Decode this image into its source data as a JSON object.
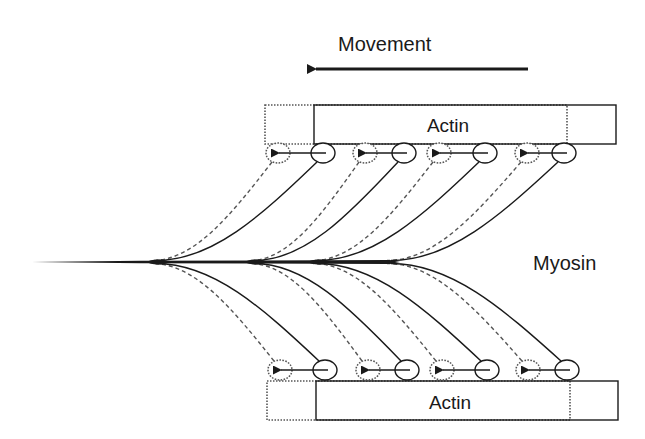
{
  "diagram": {
    "movement_label": "Movement",
    "myosin_label": "Myosin",
    "actin_top_label": "Actin",
    "actin_bottom_label": "Actin",
    "colors": {
      "stroke": "#1a1a1a",
      "dotted": "#555555",
      "background": "#ffffff"
    },
    "movement_arrow": {
      "direction": "left",
      "x1": 528,
      "x2": 308,
      "y": 69
    },
    "actin_filaments": [
      {
        "id": "top",
        "label": "Actin",
        "before": {
          "x": 265,
          "y": 105,
          "w": 302,
          "h": 39,
          "style": "dotted"
        },
        "after": {
          "x": 314,
          "y": 105,
          "w": 302,
          "h": 39,
          "style": "solid"
        }
      },
      {
        "id": "bottom",
        "label": "Actin",
        "before": {
          "x": 267,
          "y": 381,
          "w": 303,
          "h": 39,
          "style": "dotted"
        },
        "after": {
          "x": 316,
          "y": 381,
          "w": 302,
          "h": 39,
          "style": "solid"
        }
      }
    ],
    "myosin_tail": {
      "x1": 32,
      "x2": 390,
      "y": 262
    },
    "heads_top": [
      {
        "before_x": 278,
        "after_x": 323,
        "y": 153,
        "junction_x": 152
      },
      {
        "before_x": 365,
        "after_x": 404,
        "y": 153,
        "junction_x": 250
      },
      {
        "before_x": 439,
        "after_x": 485,
        "y": 153,
        "junction_x": 313
      },
      {
        "before_x": 527,
        "after_x": 564,
        "y": 153,
        "junction_x": 387
      }
    ],
    "heads_bottom": [
      {
        "before_x": 280,
        "after_x": 325,
        "y": 370,
        "junction_x": 152
      },
      {
        "before_x": 368,
        "after_x": 407,
        "y": 370,
        "junction_x": 250
      },
      {
        "before_x": 442,
        "after_x": 487,
        "y": 370,
        "junction_x": 313
      },
      {
        "before_x": 528,
        "after_x": 567,
        "y": 370,
        "junction_x": 387
      }
    ],
    "legend": {
      "dotted": "position before power stroke",
      "solid": "position after power stroke"
    }
  }
}
